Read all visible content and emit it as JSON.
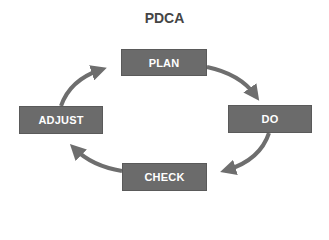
{
  "title": "PDCA",
  "steps": [
    {
      "id": "plan",
      "label": "PLAN"
    },
    {
      "id": "do",
      "label": "DO"
    },
    {
      "id": "check",
      "label": "CHECK"
    },
    {
      "id": "adjust",
      "label": "ADJUST"
    }
  ],
  "edges": [
    {
      "from": "PLAN",
      "to": "DO"
    },
    {
      "from": "DO",
      "to": "CHECK"
    },
    {
      "from": "CHECK",
      "to": "ADJUST"
    },
    {
      "from": "ADJUST",
      "to": "PLAN"
    }
  ],
  "colors": {
    "box_fill": "#6b6b6b",
    "arrow": "#6e6e6e",
    "title": "#454545",
    "box_text": "#ffffff"
  }
}
